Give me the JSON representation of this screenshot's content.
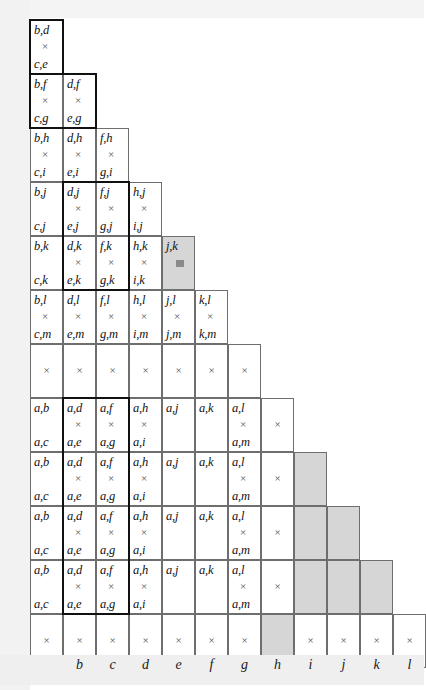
{
  "figure": {
    "axis_label_color": "#1a1a1a",
    "shade_color": "#d6d6d6",
    "grid_line_color": "#6e6e6e",
    "bold_outline_color": "#111111",
    "operator_symbol": "×"
  },
  "axis": {
    "labels": [
      "b",
      "c",
      "d",
      "e",
      "f",
      "g",
      "h",
      "i",
      "j",
      "k",
      "l"
    ],
    "start_column_index": 1
  },
  "grid": {
    "column_count": 12,
    "row_count": 12,
    "cell_width": 33,
    "cell_height": 54,
    "rows": [
      {
        "index": 0,
        "cells": [
          {
            "col": 0,
            "num": "b,d",
            "op": "×",
            "den": "c,e",
            "shaded": false
          }
        ]
      },
      {
        "index": 1,
        "cells": [
          {
            "col": 0,
            "num": "b,f",
            "op": "×",
            "den": "c,g",
            "shaded": false
          },
          {
            "col": 1,
            "num": "d,f",
            "op": "×",
            "den": "e,g",
            "shaded": false
          }
        ]
      },
      {
        "index": 2,
        "cells": [
          {
            "col": 0,
            "num": "b,h",
            "op": "×",
            "den": "c,i",
            "shaded": false
          },
          {
            "col": 1,
            "num": "d,h",
            "op": "×",
            "den": "e,i",
            "shaded": false
          },
          {
            "col": 2,
            "num": "f,h",
            "op": "×",
            "den": "g,i",
            "shaded": false
          }
        ]
      },
      {
        "index": 3,
        "cells": [
          {
            "col": 0,
            "num": "b,j",
            "op": "",
            "den": "c,j",
            "shaded": false
          },
          {
            "col": 1,
            "num": "d,j",
            "op": "×",
            "den": "e,j",
            "shaded": false
          },
          {
            "col": 2,
            "num": "f,j",
            "op": "×",
            "den": "g,j",
            "shaded": false
          },
          {
            "col": 3,
            "num": "h,j",
            "op": "×",
            "den": "i,j",
            "shaded": false
          }
        ]
      },
      {
        "index": 4,
        "cells": [
          {
            "col": 0,
            "num": "b,k",
            "op": "",
            "den": "c,k",
            "shaded": false
          },
          {
            "col": 1,
            "num": "d,k",
            "op": "×",
            "den": "e,k",
            "shaded": false
          },
          {
            "col": 2,
            "num": "f,k",
            "op": "×",
            "den": "g,k",
            "shaded": false
          },
          {
            "col": 3,
            "num": "h,k",
            "op": "×",
            "den": "i,k",
            "shaded": false
          },
          {
            "col": 4,
            "num": "j,k",
            "op": "block",
            "den": "",
            "shaded": true
          }
        ]
      },
      {
        "index": 5,
        "cells": [
          {
            "col": 0,
            "num": "b,l",
            "op": "×",
            "den": "c,m",
            "shaded": false
          },
          {
            "col": 1,
            "num": "d,l",
            "op": "×",
            "den": "e,m",
            "shaded": false
          },
          {
            "col": 2,
            "num": "f,l",
            "op": "×",
            "den": "g,m",
            "shaded": false
          },
          {
            "col": 3,
            "num": "h,l",
            "op": "×",
            "den": "i,m",
            "shaded": false
          },
          {
            "col": 4,
            "num": "j,l",
            "op": "×",
            "den": "j,m",
            "shaded": false
          },
          {
            "col": 5,
            "num": "k,l",
            "op": "×",
            "den": "k,m",
            "shaded": false
          }
        ]
      },
      {
        "index": 6,
        "cells": [
          {
            "col": 0,
            "num": "",
            "op": "×",
            "den": "",
            "shaded": false
          },
          {
            "col": 1,
            "num": "",
            "op": "×",
            "den": "",
            "shaded": false
          },
          {
            "col": 2,
            "num": "",
            "op": "×",
            "den": "",
            "shaded": false
          },
          {
            "col": 3,
            "num": "",
            "op": "×",
            "den": "",
            "shaded": false
          },
          {
            "col": 4,
            "num": "",
            "op": "×",
            "den": "",
            "shaded": false
          },
          {
            "col": 5,
            "num": "",
            "op": "×",
            "den": "",
            "shaded": false
          },
          {
            "col": 6,
            "num": "",
            "op": "×",
            "den": "",
            "shaded": false
          }
        ]
      },
      {
        "index": 7,
        "cells": [
          {
            "col": 0,
            "num": "a,b",
            "op": "",
            "den": "a,c",
            "shaded": false
          },
          {
            "col": 1,
            "num": "a,d",
            "op": "×",
            "den": "a,e",
            "shaded": false
          },
          {
            "col": 2,
            "num": "a,f",
            "op": "×",
            "den": "a,g",
            "shaded": false
          },
          {
            "col": 3,
            "num": "a,h",
            "op": "×",
            "den": "a,i",
            "shaded": false
          },
          {
            "col": 4,
            "num": "a,j",
            "op": "",
            "den": "",
            "shaded": false
          },
          {
            "col": 5,
            "num": "a,k",
            "op": "",
            "den": "",
            "shaded": false
          },
          {
            "col": 6,
            "num": "a,l",
            "op": "×",
            "den": "a,m",
            "shaded": false
          },
          {
            "col": 7,
            "num": "",
            "op": "×",
            "den": "",
            "shaded": false
          }
        ]
      },
      {
        "index": 8,
        "cells": [
          {
            "col": 0,
            "num": "a,b",
            "op": "",
            "den": "a,c",
            "shaded": false
          },
          {
            "col": 1,
            "num": "a,d",
            "op": "×",
            "den": "a,e",
            "shaded": false
          },
          {
            "col": 2,
            "num": "a,f",
            "op": "×",
            "den": "a,g",
            "shaded": false
          },
          {
            "col": 3,
            "num": "a,h",
            "op": "×",
            "den": "a,i",
            "shaded": false
          },
          {
            "col": 4,
            "num": "a,j",
            "op": "",
            "den": "",
            "shaded": false
          },
          {
            "col": 5,
            "num": "a,k",
            "op": "",
            "den": "",
            "shaded": false
          },
          {
            "col": 6,
            "num": "a,l",
            "op": "×",
            "den": "a,m",
            "shaded": false
          },
          {
            "col": 7,
            "num": "",
            "op": "×",
            "den": "",
            "shaded": false
          },
          {
            "col": 8,
            "num": "",
            "op": "",
            "den": "",
            "shaded": true
          }
        ]
      },
      {
        "index": 9,
        "cells": [
          {
            "col": 0,
            "num": "a,b",
            "op": "",
            "den": "a,c",
            "shaded": false
          },
          {
            "col": 1,
            "num": "a,d",
            "op": "×",
            "den": "a,e",
            "shaded": false
          },
          {
            "col": 2,
            "num": "a,f",
            "op": "×",
            "den": "a,g",
            "shaded": false
          },
          {
            "col": 3,
            "num": "a,h",
            "op": "×",
            "den": "a,i",
            "shaded": false
          },
          {
            "col": 4,
            "num": "a,j",
            "op": "",
            "den": "",
            "shaded": false
          },
          {
            "col": 5,
            "num": "a,k",
            "op": "",
            "den": "",
            "shaded": false
          },
          {
            "col": 6,
            "num": "a,l",
            "op": "×",
            "den": "a,m",
            "shaded": false
          },
          {
            "col": 7,
            "num": "",
            "op": "×",
            "den": "",
            "shaded": false
          },
          {
            "col": 8,
            "num": "",
            "op": "",
            "den": "",
            "shaded": true
          },
          {
            "col": 9,
            "num": "",
            "op": "",
            "den": "",
            "shaded": true
          }
        ]
      },
      {
        "index": 10,
        "cells": [
          {
            "col": 0,
            "num": "a,b",
            "op": "",
            "den": "a,c",
            "shaded": false
          },
          {
            "col": 1,
            "num": "a,d",
            "op": "×",
            "den": "a,e",
            "shaded": false
          },
          {
            "col": 2,
            "num": "a,f",
            "op": "×",
            "den": "a,g",
            "shaded": false
          },
          {
            "col": 3,
            "num": "a,h",
            "op": "×",
            "den": "a,i",
            "shaded": false
          },
          {
            "col": 4,
            "num": "a,j",
            "op": "",
            "den": "",
            "shaded": false
          },
          {
            "col": 5,
            "num": "a,k",
            "op": "",
            "den": "",
            "shaded": false
          },
          {
            "col": 6,
            "num": "a,l",
            "op": "×",
            "den": "a,m",
            "shaded": false
          },
          {
            "col": 7,
            "num": "",
            "op": "×",
            "den": "",
            "shaded": false
          },
          {
            "col": 8,
            "num": "",
            "op": "",
            "den": "",
            "shaded": true
          },
          {
            "col": 9,
            "num": "",
            "op": "",
            "den": "",
            "shaded": true
          },
          {
            "col": 10,
            "num": "",
            "op": "",
            "den": "",
            "shaded": true
          }
        ]
      },
      {
        "index": 11,
        "cells": [
          {
            "col": 0,
            "num": "",
            "op": "×",
            "den": "",
            "shaded": false
          },
          {
            "col": 1,
            "num": "",
            "op": "×",
            "den": "",
            "shaded": false
          },
          {
            "col": 2,
            "num": "",
            "op": "×",
            "den": "",
            "shaded": false
          },
          {
            "col": 3,
            "num": "",
            "op": "×",
            "den": "",
            "shaded": false
          },
          {
            "col": 4,
            "num": "",
            "op": "×",
            "den": "",
            "shaded": false
          },
          {
            "col": 5,
            "num": "",
            "op": "×",
            "den": "",
            "shaded": false
          },
          {
            "col": 6,
            "num": "",
            "op": "×",
            "den": "",
            "shaded": false
          },
          {
            "col": 7,
            "num": "",
            "op": "",
            "den": "",
            "shaded": true
          },
          {
            "col": 8,
            "num": "",
            "op": "×",
            "den": "",
            "shaded": false
          },
          {
            "col": 9,
            "num": "",
            "op": "×",
            "den": "",
            "shaded": false
          },
          {
            "col": 10,
            "num": "",
            "op": "×",
            "den": "",
            "shaded": false
          },
          {
            "col": 11,
            "num": "",
            "op": "×",
            "den": "",
            "shaded": false
          }
        ]
      }
    ]
  },
  "bold_outlines": [
    {
      "name": "outline-top-col0-row0",
      "col": 0,
      "row": 0,
      "cols": 1,
      "rows": 1
    },
    {
      "name": "outline-row1-cols01",
      "col": 0,
      "row": 1,
      "cols": 2,
      "rows": 1
    },
    {
      "name": "outline-rows34-cols12",
      "col": 1,
      "row": 3,
      "cols": 2,
      "rows": 2
    },
    {
      "name": "outline-rows7to10-cols12",
      "col": 1,
      "row": 7,
      "cols": 2,
      "rows": 4
    }
  ]
}
